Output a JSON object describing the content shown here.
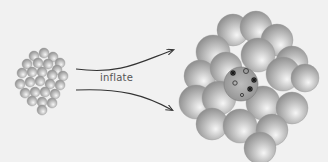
{
  "diagram": {
    "label": "inflate",
    "colors": {
      "background": "#f1f1f1",
      "sphere_light": "#f4f4f4",
      "sphere_mid": "#bdbdbd",
      "sphere_dark": "#8a8a8a",
      "arrow": "#333333",
      "marks": "#1a1a1a"
    },
    "small_cluster": {
      "description": "small cluster of spheres",
      "spheres": [
        [
          34,
          56,
          5
        ],
        [
          44,
          53,
          5
        ],
        [
          53,
          57,
          5
        ],
        [
          60,
          63,
          5
        ],
        [
          27,
          64,
          5
        ],
        [
          38,
          63,
          5
        ],
        [
          48,
          64,
          5
        ],
        [
          57,
          70,
          5
        ],
        [
          22,
          73,
          5
        ],
        [
          32,
          72,
          5
        ],
        [
          42,
          72,
          5
        ],
        [
          52,
          75,
          5
        ],
        [
          63,
          76,
          5
        ],
        [
          20,
          84,
          5
        ],
        [
          30,
          82,
          5
        ],
        [
          40,
          81,
          5
        ],
        [
          50,
          84,
          5
        ],
        [
          60,
          85,
          5
        ],
        [
          25,
          93,
          5
        ],
        [
          35,
          92,
          5
        ],
        [
          45,
          92,
          5
        ],
        [
          55,
          94,
          5
        ],
        [
          32,
          101,
          5
        ],
        [
          42,
          102,
          5
        ],
        [
          52,
          103,
          5
        ],
        [
          42,
          110,
          5
        ]
      ]
    },
    "large_cluster": {
      "description": "inflated cluster of spheres",
      "spheres": [
        [
          233,
          30,
          16
        ],
        [
          256,
          27,
          16
        ],
        [
          277,
          40,
          16
        ],
        [
          213,
          52,
          17
        ],
        [
          258,
          55,
          17
        ],
        [
          292,
          62,
          16
        ],
        [
          200,
          76,
          16
        ],
        [
          226,
          68,
          16
        ],
        [
          283,
          74,
          17
        ],
        [
          305,
          78,
          14
        ],
        [
          196,
          102,
          17
        ],
        [
          219,
          98,
          17
        ],
        [
          263,
          103,
          17
        ],
        [
          292,
          108,
          16
        ],
        [
          212,
          124,
          16
        ],
        [
          240,
          126,
          17
        ],
        [
          272,
          130,
          16
        ],
        [
          260,
          148,
          16
        ]
      ],
      "center_sphere": [
        241,
        84,
        17
      ],
      "marks": {
        "stars": [
          [
            233,
            73
          ],
          [
            254,
            80
          ],
          [
            250,
            89
          ]
        ],
        "rings": [
          [
            246,
            71,
            2.5
          ],
          [
            235,
            83,
            2.2
          ],
          [
            242,
            95,
            1.6
          ]
        ]
      }
    },
    "arrows": [
      {
        "path": "M76,69 C120,75 140,62 173,50"
      },
      {
        "path": "M76,90 C120,88 145,95 172,110"
      }
    ]
  }
}
